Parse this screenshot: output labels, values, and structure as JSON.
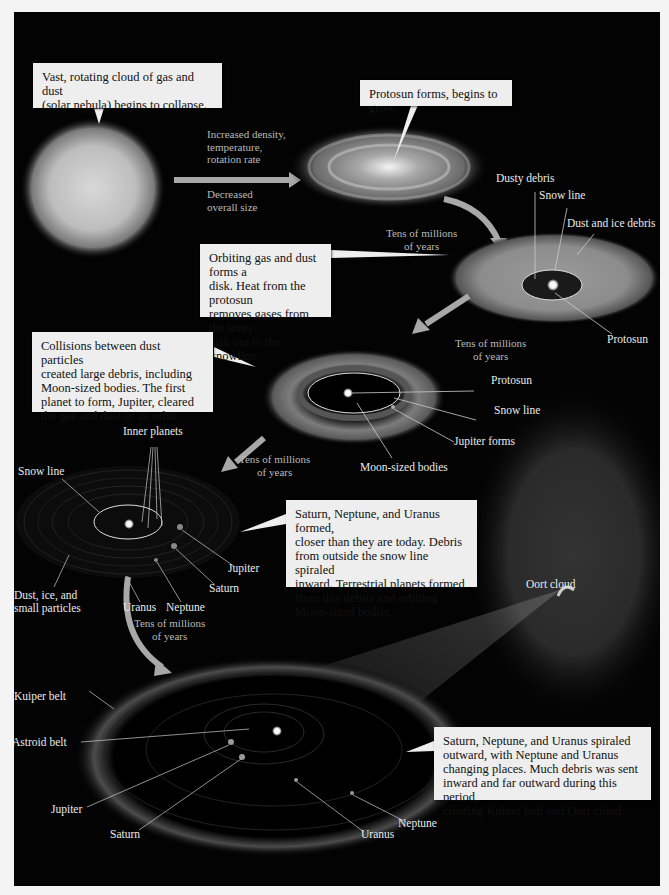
{
  "colors": {
    "background": "#030303",
    "border": "#f4f4f4",
    "callout_fill": "#eeeeee",
    "label_text": "#eaeaea",
    "arrow_fill": "#a8a8a8"
  },
  "stages": [
    {
      "id": 1,
      "callout": "Vast, rotating cloud of gas and dust\n(solar nebula) begins to collapse."
    },
    {
      "id": 2,
      "callout": "Protosun forms, begins to grow.",
      "transition_above": "Increased density,\ntemperature,\nrotation rate",
      "transition_below": "Decreased\noverall size"
    },
    {
      "id": 3,
      "callout": "Orbiting gas and dust forms a\ndisk.  Heat from the protosun\nremoves gases from the inner\ndisk out to the 'snowline.'",
      "transition": "Tens of millions\nof years",
      "labels": [
        "Dusty debris",
        "Snow line",
        "Dust and ice debris",
        "Protosun"
      ]
    },
    {
      "id": 4,
      "callout": "Collisions between dust particles\ncreated large debris, including\nMoon-sized bodies.  The first\nplanet to form, Jupiter, cleared\nthe gas and dust in its orbit.",
      "transition": "Tens of millions\nof years",
      "labels": [
        "Protosun",
        "Snow line",
        "Jupiter forms",
        "Moon-sized bodies"
      ]
    },
    {
      "id": 5,
      "callout": "Saturn, Neptune, and Uranus formed,\ncloser than they are today.  Debris\nfrom outside the snow line spiraled\ninward.  Terrestrial planets formed\nfrom this debris and orbiting\nMoon-sized bodies.",
      "transition": "Tens of millions\nof years",
      "labels": [
        "Inner planets",
        "Snow line",
        "Jupiter",
        "Saturn",
        "Uranus",
        "Neptune",
        "Dust, ice, and\nsmall particles"
      ]
    },
    {
      "id": 6,
      "callout": "Saturn, Neptune, and Uranus spiraled\noutward, with Neptune and Uranus\nchanging places.  Much debris was sent\ninward and far outward during this period,\ncreating Kuiper belt and Oort cloud.",
      "transition": "Tens of millions\nof years",
      "labels": [
        "Kuiper belt",
        "Astroid belt",
        "Jupiter",
        "Saturn",
        "Uranus",
        "Neptune",
        "Oort cloud"
      ]
    }
  ]
}
